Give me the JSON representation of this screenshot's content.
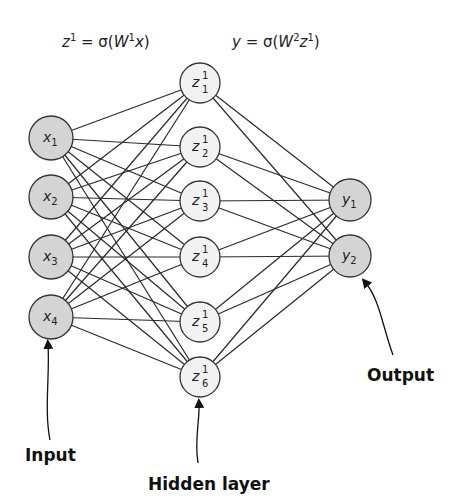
{
  "equations": {
    "hidden": {
      "lhs": "z",
      "lhs_sup": "1",
      "eq": " = σ(",
      "w": "W",
      "w_sup": "1",
      "arg": "x",
      "close": ")"
    },
    "output": {
      "lhs": "y",
      "eq": " = σ(",
      "w": "W",
      "w_sup": "2",
      "arg": "z",
      "arg_sup": "1",
      "close": ")"
    }
  },
  "layers": {
    "input": {
      "label": "Input",
      "fill": "#d4d4d4",
      "nodes": [
        {
          "base": "x",
          "sub": "1",
          "cx": 51,
          "cy": 138
        },
        {
          "base": "x",
          "sub": "2",
          "cx": 51,
          "cy": 197
        },
        {
          "base": "x",
          "sub": "3",
          "cx": 51,
          "cy": 257
        },
        {
          "base": "x",
          "sub": "4",
          "cx": 51,
          "cy": 317
        }
      ]
    },
    "hidden": {
      "label": "Hidden layer",
      "fill": "#f2f2f2",
      "nodes": [
        {
          "base": "z",
          "sup": "1",
          "sub": "1",
          "cx": 200,
          "cy": 83
        },
        {
          "base": "z",
          "sup": "1",
          "sub": "2",
          "cx": 200,
          "cy": 147
        },
        {
          "base": "z",
          "sup": "1",
          "sub": "3",
          "cx": 200,
          "cy": 201
        },
        {
          "base": "z",
          "sup": "1",
          "sub": "4",
          "cx": 200,
          "cy": 257
        },
        {
          "base": "z",
          "sup": "1",
          "sub": "5",
          "cx": 200,
          "cy": 322
        },
        {
          "base": "z",
          "sup": "1",
          "sub": "6",
          "cx": 200,
          "cy": 377
        }
      ]
    },
    "output": {
      "label": "Output",
      "fill": "#d4d4d4",
      "nodes": [
        {
          "base": "y",
          "sub": "1",
          "cx": 350,
          "cy": 200
        },
        {
          "base": "y",
          "sub": "2",
          "cx": 350,
          "cy": 256
        }
      ]
    }
  },
  "colors": {
    "stroke": "#333333",
    "edge": "#2a2a2a"
  }
}
